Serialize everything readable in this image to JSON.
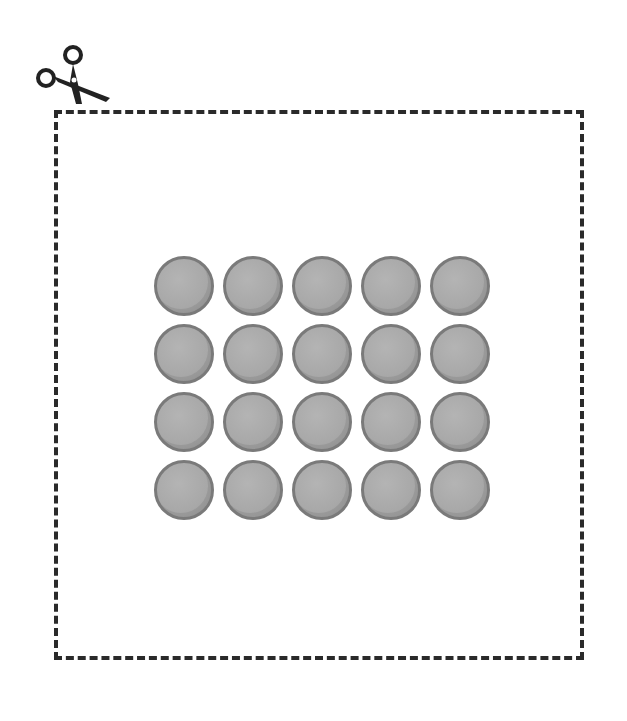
{
  "illustration": {
    "cut_line": {
      "style": "dashed",
      "color": "#2a2a2a"
    },
    "scissors_icon": "scissors-icon",
    "tokens": {
      "rows": 4,
      "columns": 5,
      "count": 20,
      "shape": "circle",
      "fill_color": "#a8a8a8",
      "border_color": "#7a7a7a"
    }
  }
}
